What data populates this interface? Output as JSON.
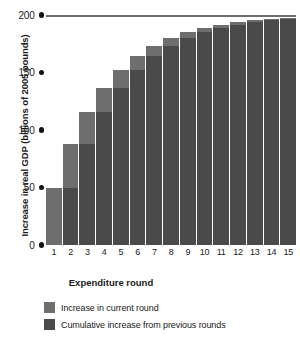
{
  "chart_data": {
    "type": "bar",
    "title": "",
    "xlabel": "Expenditure round",
    "ylabel": "Increase in real GDP (billions of 2005 pounds)",
    "categories": [
      "1",
      "2",
      "3",
      "4",
      "5",
      "6",
      "7",
      "8",
      "9",
      "10",
      "11",
      "12",
      "13",
      "14",
      "15"
    ],
    "ylim": [
      0,
      200
    ],
    "yticks": [
      0,
      50,
      100,
      150,
      200
    ],
    "ytick_labels": [
      "0",
      "50",
      "100",
      "150",
      "200"
    ],
    "grid": false,
    "gridline_at": 200,
    "stacked": true,
    "legend_position": "bottom-left",
    "series": [
      {
        "name": "Cumulative increase from previous rounds",
        "color": "#4a4a4a",
        "values": [
          0,
          50,
          87.5,
          115.6,
          136.7,
          152.5,
          164.4,
          173.3,
          180.0,
          185.0,
          188.7,
          191.5,
          193.7,
          195.3,
          196.5
        ]
      },
      {
        "name": "Increase in current round",
        "color": "#6e6e6e",
        "values": [
          50,
          37.5,
          28.1,
          21.1,
          15.8,
          11.9,
          8.9,
          6.7,
          5.0,
          3.8,
          2.8,
          2.1,
          1.6,
          1.2,
          0.9
        ]
      }
    ],
    "totals": [
      50,
      87.5,
      115.6,
      136.7,
      152.5,
      164.4,
      173.3,
      180.0,
      185.0,
      188.7,
      191.5,
      193.7,
      195.3,
      196.5,
      197.4
    ]
  },
  "axes": {
    "y_title": "Increase in real GDP (billions of 2005 pounds)",
    "x_title": "Expenditure round",
    "y_tick_labels": [
      "200",
      "150",
      "100",
      "50",
      "0"
    ]
  },
  "legend": {
    "items": [
      {
        "label": "Increase in current round",
        "color": "#6e6e6e"
      },
      {
        "label": "Cumulative increase from previous rounds",
        "color": "#4a4a4a"
      }
    ]
  },
  "colors": {
    "current_round": "#6e6e6e",
    "cumulative": "#4a4a4a",
    "gridline": "#6f6f6f",
    "tick_dot": "#111111",
    "background": "#ffffff"
  }
}
